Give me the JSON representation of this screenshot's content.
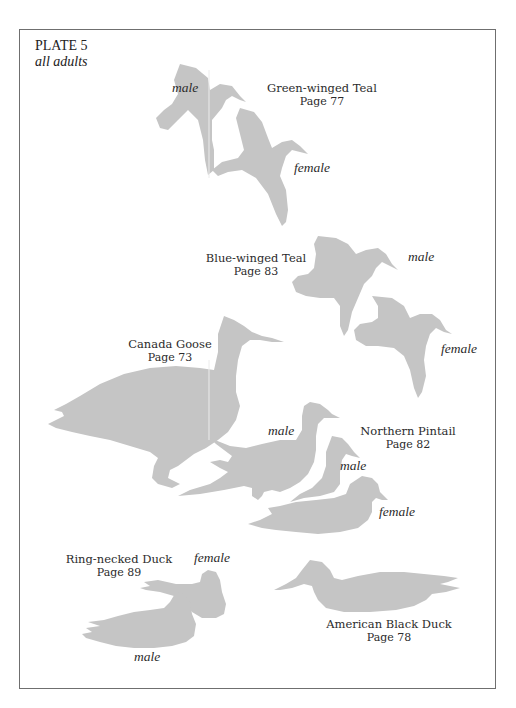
{
  "plate": {
    "title": "PLATE 5",
    "subtitle": "all adults"
  },
  "colors": {
    "silhouette": "#c5c5c5",
    "border": "#6f6f6f",
    "text": "#2b2b2b"
  },
  "species": [
    {
      "name": "Green-winged Teal",
      "page": "Page 77",
      "labels": [
        "male",
        "female"
      ]
    },
    {
      "name": "Blue-winged Teal",
      "page": "Page 83",
      "labels": [
        "male",
        "female"
      ]
    },
    {
      "name": "Canada Goose",
      "page": "Page 73",
      "labels": []
    },
    {
      "name": "Northern Pintail",
      "page": "Page 82",
      "labels": [
        "male",
        "male",
        "female"
      ]
    },
    {
      "name": "Ring-necked Duck",
      "page": "Page 89",
      "labels": [
        "female",
        "male"
      ]
    },
    {
      "name": "American Black Duck",
      "page": "Page 78",
      "labels": []
    }
  ]
}
